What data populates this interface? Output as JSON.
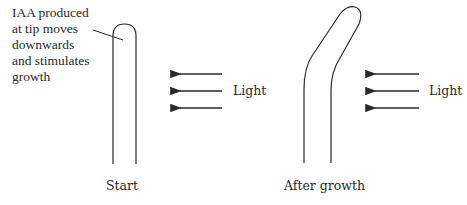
{
  "figure": {
    "annotation": {
      "lines": [
        "IAA produced",
        "at tip moves",
        "downwards",
        "and stimulates",
        "growth"
      ]
    },
    "panels": [
      {
        "label": "Start",
        "light_label": "Light",
        "shoot": "straight"
      },
      {
        "label": "After growth",
        "light_label": "Light",
        "shoot": "bent-toward-light"
      }
    ],
    "light_arrows_per_panel": 3,
    "colors": {
      "line": "#2a2a2a",
      "background": "#ffffff"
    }
  }
}
